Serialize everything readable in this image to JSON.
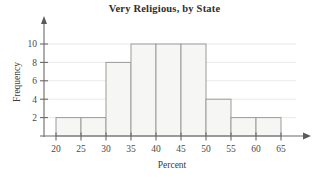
{
  "chart_data": {
    "type": "bar",
    "title": "Very Religious, by State",
    "xlabel": "Percent",
    "ylabel": "Frequency",
    "bin_edges": [
      20,
      25,
      30,
      35,
      40,
      45,
      50,
      55,
      60,
      65
    ],
    "categories": [
      "20-25",
      "25-30",
      "30-35",
      "35-40",
      "40-45",
      "45-50",
      "50-55",
      "55-60",
      "60-65"
    ],
    "values": [
      2,
      2,
      8,
      10,
      10,
      10,
      4,
      2,
      2
    ],
    "xlim": [
      20,
      65
    ],
    "ylim": [
      0,
      10
    ],
    "xticks": [
      20,
      25,
      30,
      35,
      40,
      45,
      50,
      55,
      60,
      65
    ],
    "xtick_labels": [
      "20",
      "25",
      "30",
      "35",
      "40",
      "45",
      "50",
      "55",
      "60",
      "65"
    ],
    "yticks": [
      2,
      4,
      6,
      8,
      10
    ],
    "ytick_labels": [
      "2",
      "4",
      "6",
      "8",
      "10"
    ],
    "grid": "horizontal",
    "legend": "none",
    "bar_fill_color": "#f6f6f4",
    "bar_edge_color": "#9b9b9b",
    "gridline_color": "#e9e9e9",
    "axis_color": "#6a6a6a"
  }
}
